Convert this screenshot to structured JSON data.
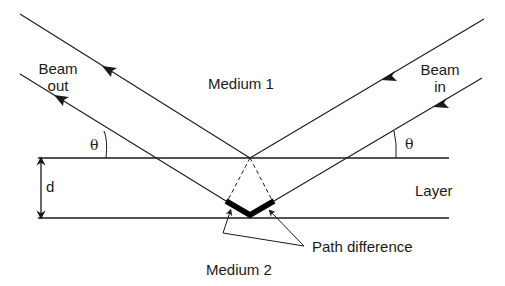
{
  "diagram": {
    "labels": {
      "beam_out_line1": "Beam",
      "beam_out_line2": "out",
      "beam_in_line1": "Beam",
      "beam_in_line2": "in",
      "medium1": "Medium 1",
      "medium2": "Medium 2",
      "layer": "Layer",
      "thickness": "d",
      "theta_left": "θ",
      "theta_right": "θ",
      "path_difference": "Path difference"
    },
    "colors": {
      "line": "#1a1a1a",
      "background": "#ffffff"
    }
  }
}
